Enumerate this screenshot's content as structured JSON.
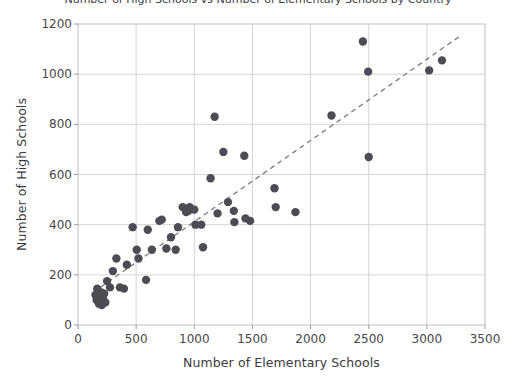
{
  "chart_data": {
    "type": "scatter",
    "title": "Number of High Schools vs Number of Elementary Schools by Country",
    "xlabel": "Number of Elementary Schools",
    "ylabel": "Number of High Schools",
    "xlim": [
      0,
      3500
    ],
    "ylim": [
      0,
      1200
    ],
    "xticks": [
      0,
      500,
      1000,
      1500,
      2000,
      2500,
      3000,
      3500
    ],
    "yticks": [
      0,
      200,
      400,
      600,
      800,
      1000,
      1200
    ],
    "grid": true,
    "legend": "none",
    "marker_color": "#4c4c54",
    "marker_size": 6.5,
    "trendline": {
      "style": "dashed",
      "color": "#7a7a80",
      "x": [
        130,
        3280
      ],
      "y": [
        130,
        1150
      ]
    },
    "points": [
      {
        "x": 150,
        "y": 120
      },
      {
        "x": 160,
        "y": 100
      },
      {
        "x": 165,
        "y": 145
      },
      {
        "x": 180,
        "y": 85
      },
      {
        "x": 185,
        "y": 110
      },
      {
        "x": 195,
        "y": 95
      },
      {
        "x": 200,
        "y": 130
      },
      {
        "x": 205,
        "y": 80
      },
      {
        "x": 215,
        "y": 105
      },
      {
        "x": 225,
        "y": 125
      },
      {
        "x": 235,
        "y": 90
      },
      {
        "x": 250,
        "y": 175
      },
      {
        "x": 275,
        "y": 150
      },
      {
        "x": 300,
        "y": 215
      },
      {
        "x": 330,
        "y": 265
      },
      {
        "x": 360,
        "y": 150
      },
      {
        "x": 395,
        "y": 145
      },
      {
        "x": 420,
        "y": 240
      },
      {
        "x": 470,
        "y": 390
      },
      {
        "x": 505,
        "y": 300
      },
      {
        "x": 520,
        "y": 265
      },
      {
        "x": 585,
        "y": 180
      },
      {
        "x": 600,
        "y": 380
      },
      {
        "x": 635,
        "y": 300
      },
      {
        "x": 700,
        "y": 415
      },
      {
        "x": 720,
        "y": 420
      },
      {
        "x": 760,
        "y": 305
      },
      {
        "x": 800,
        "y": 350
      },
      {
        "x": 840,
        "y": 300
      },
      {
        "x": 860,
        "y": 390
      },
      {
        "x": 900,
        "y": 470
      },
      {
        "x": 930,
        "y": 450
      },
      {
        "x": 950,
        "y": 455
      },
      {
        "x": 960,
        "y": 470
      },
      {
        "x": 1000,
        "y": 460
      },
      {
        "x": 1010,
        "y": 400
      },
      {
        "x": 1060,
        "y": 400
      },
      {
        "x": 1075,
        "y": 310
      },
      {
        "x": 1140,
        "y": 585
      },
      {
        "x": 1175,
        "y": 830
      },
      {
        "x": 1200,
        "y": 445
      },
      {
        "x": 1250,
        "y": 690
      },
      {
        "x": 1290,
        "y": 490
      },
      {
        "x": 1340,
        "y": 455
      },
      {
        "x": 1345,
        "y": 410
      },
      {
        "x": 1430,
        "y": 675
      },
      {
        "x": 1440,
        "y": 425
      },
      {
        "x": 1480,
        "y": 415
      },
      {
        "x": 1690,
        "y": 545
      },
      {
        "x": 1700,
        "y": 470
      },
      {
        "x": 1870,
        "y": 450
      },
      {
        "x": 2180,
        "y": 835
      },
      {
        "x": 2450,
        "y": 1130
      },
      {
        "x": 2495,
        "y": 1010
      },
      {
        "x": 2500,
        "y": 670
      },
      {
        "x": 3020,
        "y": 1015
      },
      {
        "x": 3130,
        "y": 1055
      }
    ]
  }
}
